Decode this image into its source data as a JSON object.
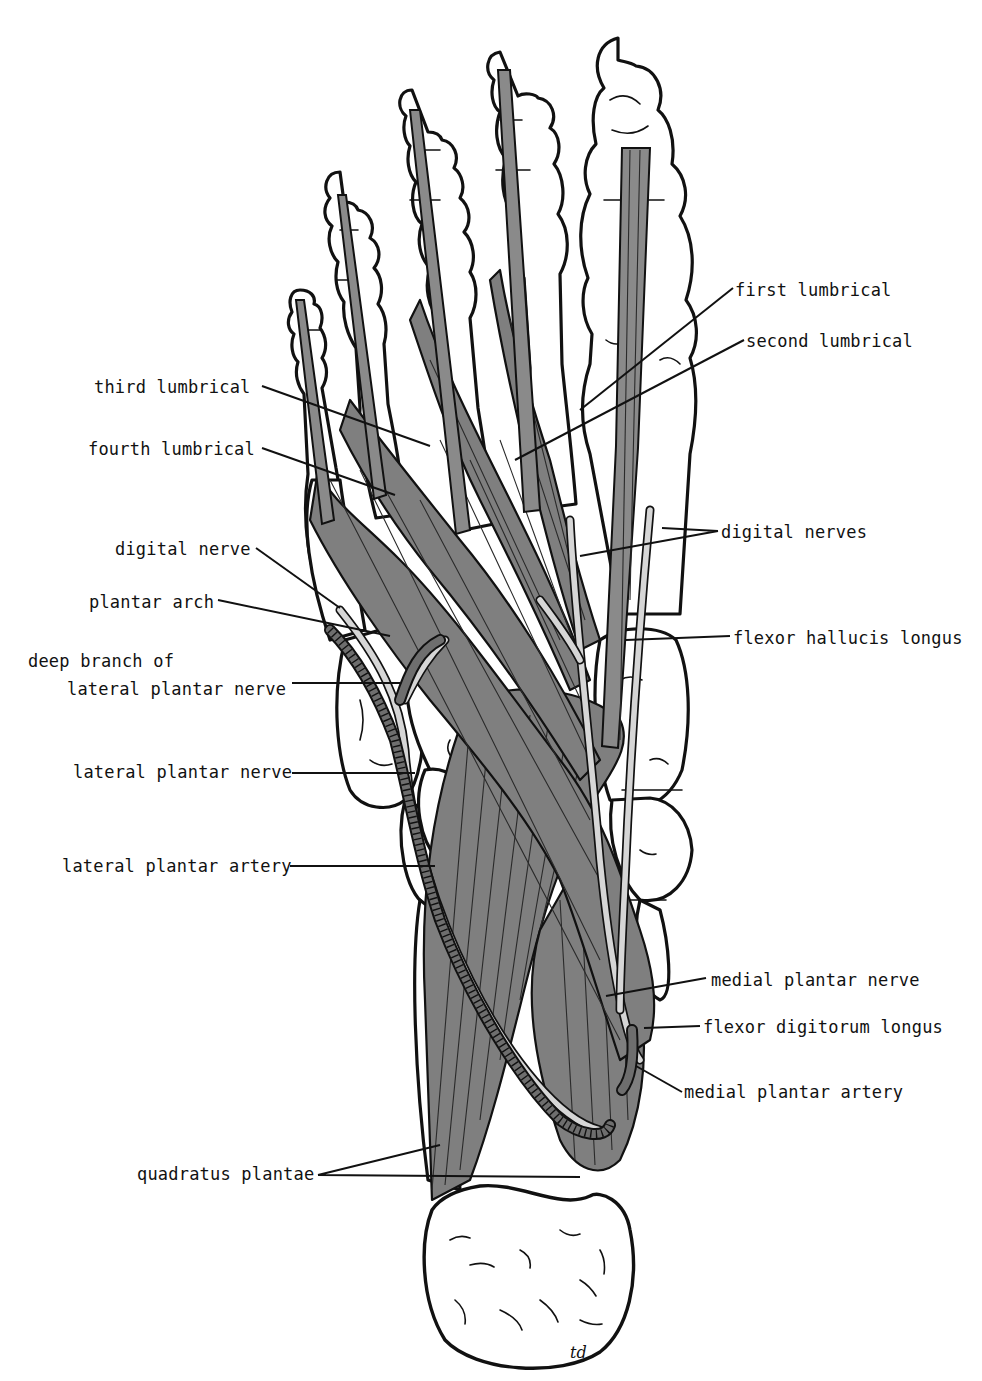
{
  "figure": {
    "signature": "td",
    "colors": {
      "background": "#ffffff",
      "line": "#111111",
      "muscle": "#7f7f7f",
      "nerve": "#d6d6d6",
      "artery": "#6e6e6e"
    }
  },
  "labels_left": [
    {
      "id": "third-lumbrical",
      "text": "third lumbrical",
      "x": 94,
      "y": 377
    },
    {
      "id": "fourth-lumbrical",
      "text": "fourth lumbrical",
      "x": 88,
      "y": 439
    },
    {
      "id": "digital-nerve",
      "text": "digital nerve",
      "x": 115,
      "y": 539
    },
    {
      "id": "plantar-arch",
      "text": "plantar arch",
      "x": 89,
      "y": 592
    },
    {
      "id": "deep-branch-line1",
      "text": "deep branch of",
      "x": 28,
      "y": 651
    },
    {
      "id": "deep-branch-line2",
      "text": "lateral plantar nerve",
      "x": 67,
      "y": 679
    },
    {
      "id": "lateral-plantar-nerve",
      "text": "lateral plantar nerve",
      "x": 73,
      "y": 762
    },
    {
      "id": "lateral-plantar-artery",
      "text": "lateral plantar artery",
      "x": 62,
      "y": 856
    },
    {
      "id": "quadratus-plantae",
      "text": "quadratus plantae",
      "x": 137,
      "y": 1164
    }
  ],
  "labels_right": [
    {
      "id": "first-lumbrical",
      "text": "first lumbrical",
      "x": 735,
      "y": 280
    },
    {
      "id": "second-lumbrical",
      "text": "second lumbrical",
      "x": 746,
      "y": 331
    },
    {
      "id": "digital-nerves",
      "text": "digital nerves",
      "x": 721,
      "y": 522
    },
    {
      "id": "flexor-hallucis-longus",
      "text": "flexor hallucis longus",
      "x": 733,
      "y": 628
    },
    {
      "id": "medial-plantar-nerve",
      "text": "medial plantar nerve",
      "x": 711,
      "y": 970
    },
    {
      "id": "flexor-digitorum-longus",
      "text": "flexor digitorum longus",
      "x": 703,
      "y": 1017
    },
    {
      "id": "medial-plantar-artery",
      "text": "medial plantar artery",
      "x": 684,
      "y": 1082
    }
  ]
}
